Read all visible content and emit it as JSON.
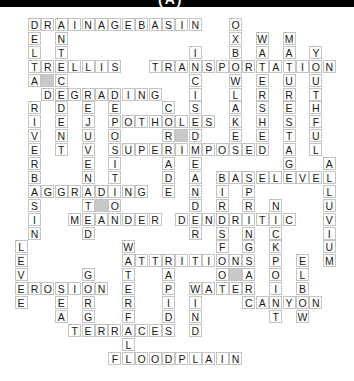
{
  "header": {
    "title": "(A)"
  },
  "grid": {
    "cols": 24,
    "rows": 26,
    "cell_w": 13.4,
    "cell_h": 13.9,
    "x0": 14.6,
    "y0": 18
  },
  "colors": {
    "border": "#c4c4c4",
    "shade": "#c8c8c8",
    "text": "#1a1a1a",
    "header": "#000000"
  },
  "shaded_cells": [
    [
      4,
      2
    ],
    [
      8,
      12
    ],
    [
      13,
      6
    ],
    [
      18,
      16
    ]
  ],
  "words": [
    {
      "word": "DRAINAGEBASIN",
      "row": 0,
      "col": 1,
      "dir": "across"
    },
    {
      "word": "DELTA",
      "row": 0,
      "col": 1,
      "dir": "down"
    },
    {
      "word": "ANTECEDENT",
      "row": 0,
      "col": 3,
      "dir": "down"
    },
    {
      "word": "OXBOWLAKES",
      "row": 0,
      "col": 16,
      "dir": "down"
    },
    {
      "word": "WATERSHED",
      "row": 1,
      "col": 18,
      "dir": "down"
    },
    {
      "word": "MATURESTAGE",
      "row": 1,
      "col": 20,
      "dir": "down"
    },
    {
      "word": "INCISEDMEANDER",
      "row": 2,
      "col": 13,
      "dir": "down"
    },
    {
      "word": "YOUTHFUL",
      "row": 2,
      "col": 22,
      "dir": "down"
    },
    {
      "word": "TRELLIS",
      "row": 3,
      "col": 1,
      "dir": "across"
    },
    {
      "word": "TRANSPORTATION",
      "row": 3,
      "col": 10,
      "dir": "across"
    },
    {
      "word": "DEGRADING",
      "row": 5,
      "col": 2,
      "dir": "across"
    },
    {
      "word": "REJUVENATED",
      "row": 5,
      "col": 5,
      "dir": "down"
    },
    {
      "word": "DEPOSITION",
      "row": 5,
      "col": 7,
      "dir": "down"
    },
    {
      "word": "RIVERBASIN",
      "row": 6,
      "col": 1,
      "dir": "down"
    },
    {
      "word": "CORRADE",
      "row": 6,
      "col": 11,
      "dir": "down"
    },
    {
      "word": "POTHOLES",
      "row": 7,
      "col": 7,
      "dir": "across"
    },
    {
      "word": "SUPERIMPOSED",
      "row": 9,
      "col": 7,
      "dir": "across"
    },
    {
      "word": "ALLUVIUM",
      "row": 10,
      "col": 23,
      "dir": "down"
    },
    {
      "word": "BASELEVEL",
      "row": 11,
      "col": 15,
      "dir": "across"
    },
    {
      "word": "BIRDSFOOT",
      "row": 11,
      "col": 15,
      "dir": "down"
    },
    {
      "word": "SPRINGS",
      "row": 11,
      "col": 17,
      "dir": "down"
    },
    {
      "word": "AGGRADING",
      "row": 12,
      "col": 1,
      "dir": "across"
    },
    {
      "word": "NICKPOINT",
      "row": 13,
      "col": 19,
      "dir": "down"
    },
    {
      "word": "MEANDER",
      "row": 14,
      "col": 4,
      "dir": "across"
    },
    {
      "word": "DENDRITIC",
      "row": 14,
      "col": 12,
      "dir": "across"
    },
    {
      "word": "LEVEE",
      "row": 16,
      "col": 0,
      "dir": "down"
    },
    {
      "word": "WATERFALL",
      "row": 16,
      "col": 8,
      "dir": "down"
    },
    {
      "word": "ATTRITION",
      "row": 17,
      "col": 8,
      "dir": "across"
    },
    {
      "word": "RAPIDS",
      "row": 17,
      "col": 11,
      "dir": "down"
    },
    {
      "word": "ELBOW",
      "row": 17,
      "col": 21,
      "dir": "down"
    },
    {
      "word": "GORGE",
      "row": 18,
      "col": 5,
      "dir": "down"
    },
    {
      "word": "ARC",
      "row": 18,
      "col": 17,
      "dir": "down"
    },
    {
      "word": "EROSION",
      "row": 19,
      "col": 0,
      "dir": "across"
    },
    {
      "word": "SEA",
      "row": 19,
      "col": 3,
      "dir": "down"
    },
    {
      "word": "WATER",
      "row": 19,
      "col": 13,
      "dir": "across"
    },
    {
      "word": "WIND",
      "row": 19,
      "col": 13,
      "dir": "down"
    },
    {
      "word": "CANYON",
      "row": 20,
      "col": 17,
      "dir": "across"
    },
    {
      "word": "TERRACES",
      "row": 22,
      "col": 4,
      "dir": "across"
    },
    {
      "word": "FLOODPLAIN",
      "row": 24,
      "col": 7,
      "dir": "across"
    }
  ]
}
